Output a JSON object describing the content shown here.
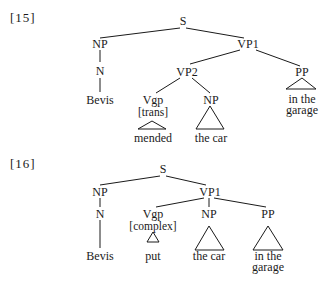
{
  "trees": [
    {
      "label": "[15]",
      "nodes": {
        "s": "S",
        "np": "NP",
        "vp1": "VP1",
        "n": "N",
        "bevis": "Bevis",
        "vp2": "VP2",
        "pp": "PP",
        "pp_text_1": "in the",
        "pp_text_2": "garage",
        "vgp": "Vgp",
        "vgp_feature": "[trans]",
        "np2": "NP",
        "vgp_text": "mended",
        "np2_text": "the car"
      }
    },
    {
      "label": "[16]",
      "nodes": {
        "s": "S",
        "np": "NP",
        "vp1": "VP1",
        "n": "N",
        "bevis": "Bevis",
        "vgp": "Vgp",
        "vgp_feature": "[complex]",
        "vgp_text": "put",
        "np2": "NP",
        "np2_text": "the car",
        "pp": "PP",
        "pp_text_1": "in the",
        "pp_text_2": "garage"
      }
    }
  ]
}
